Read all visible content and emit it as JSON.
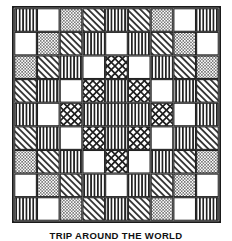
{
  "figure": {
    "caption": "TRIP AROUND THE WORLD",
    "grid": {
      "rows": 9,
      "cols": 9,
      "border_color": "#1a1a1a",
      "line_color": "#222222",
      "background_color": "#ffffff"
    },
    "legend": {
      "blank": "blank-patch",
      "vertical": "vertical-stripe-patch",
      "dots": "dotted-stipple-patch",
      "diagonal": "diagonal-hatch-patch",
      "cross": "crosshatch-patch"
    },
    "patches": [
      [
        "vertical",
        "blank",
        "dots",
        "diagonal",
        "vertical",
        "diagonal",
        "dots",
        "blank",
        "vertical"
      ],
      [
        "blank",
        "dots",
        "diagonal",
        "vertical",
        "blank",
        "vertical",
        "diagonal",
        "dots",
        "blank"
      ],
      [
        "dots",
        "diagonal",
        "vertical",
        "blank",
        "cross",
        "blank",
        "vertical",
        "diagonal",
        "dots"
      ],
      [
        "diagonal",
        "vertical",
        "blank",
        "cross",
        "vertical",
        "cross",
        "blank",
        "vertical",
        "diagonal"
      ],
      [
        "vertical",
        "blank",
        "cross",
        "vertical",
        "vertical",
        "vertical",
        "cross",
        "blank",
        "vertical"
      ],
      [
        "diagonal",
        "vertical",
        "blank",
        "cross",
        "vertical",
        "cross",
        "blank",
        "vertical",
        "diagonal"
      ],
      [
        "dots",
        "diagonal",
        "vertical",
        "blank",
        "cross",
        "blank",
        "vertical",
        "diagonal",
        "dots"
      ],
      [
        "blank",
        "dots",
        "diagonal",
        "vertical",
        "blank",
        "vertical",
        "diagonal",
        "dots",
        "blank"
      ],
      [
        "vertical",
        "blank",
        "dots",
        "diagonal",
        "vertical",
        "diagonal",
        "dots",
        "blank",
        "vertical"
      ]
    ]
  }
}
